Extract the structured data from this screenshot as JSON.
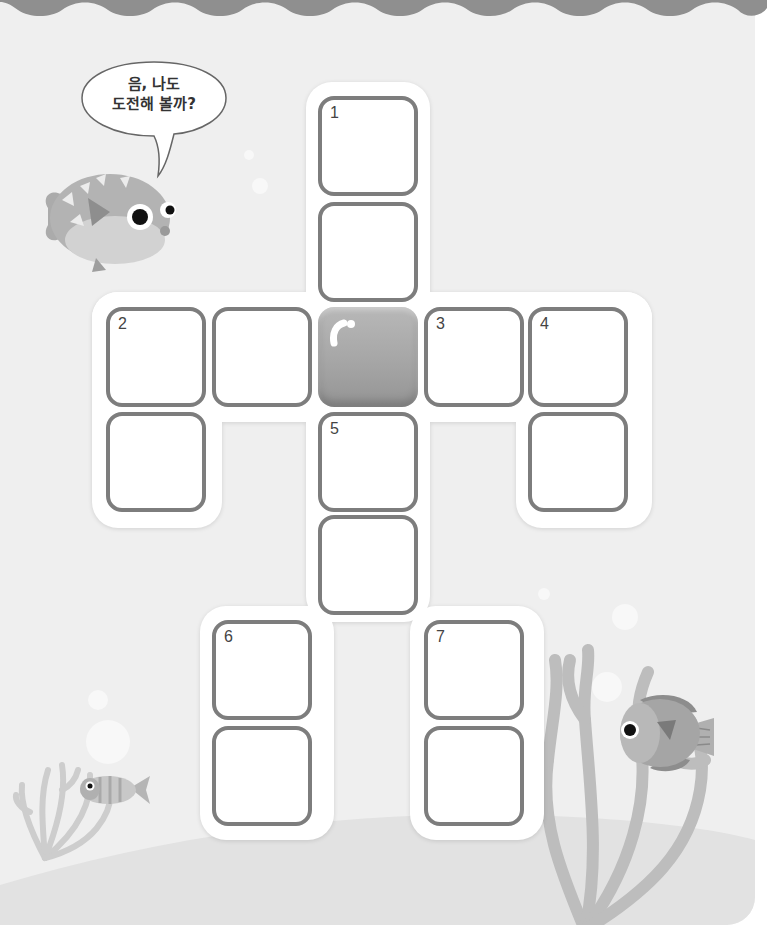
{
  "page": {
    "background_color": "#efefef",
    "wave_color": "#8f8f8f",
    "seafloor_color": "#e2e2e2"
  },
  "speech_bubble": {
    "line1": "음, 나도",
    "line2": "도전해 볼까?"
  },
  "characters": [
    {
      "name": "pufferfish",
      "position": "upper-left"
    },
    {
      "name": "striped-fish",
      "position": "lower-left"
    },
    {
      "name": "round-fish",
      "position": "lower-right"
    }
  ],
  "crossword": {
    "cell_border_color": "#7d7d7d",
    "cell_fill_color": "#ffffff",
    "blocked_cell_color": "#a8a8a8",
    "cells": [
      {
        "id": "r0c2",
        "x": 318,
        "y": 96,
        "number": "1",
        "blocked": false
      },
      {
        "id": "r1c2",
        "x": 318,
        "y": 202,
        "number": "",
        "blocked": false
      },
      {
        "id": "r2c0",
        "x": 106,
        "y": 307,
        "number": "2",
        "blocked": false
      },
      {
        "id": "r2c1",
        "x": 212,
        "y": 307,
        "number": "",
        "blocked": false
      },
      {
        "id": "r2c2",
        "x": 318,
        "y": 307,
        "number": "",
        "blocked": true
      },
      {
        "id": "r2c3",
        "x": 424,
        "y": 307,
        "number": "3",
        "blocked": false
      },
      {
        "id": "r2c4",
        "x": 528,
        "y": 307,
        "number": "4",
        "blocked": false
      },
      {
        "id": "r3c0",
        "x": 106,
        "y": 412,
        "number": "",
        "blocked": false
      },
      {
        "id": "r3c2",
        "x": 318,
        "y": 412,
        "number": "5",
        "blocked": false
      },
      {
        "id": "r3c4",
        "x": 528,
        "y": 412,
        "number": "",
        "blocked": false
      },
      {
        "id": "r4c2",
        "x": 318,
        "y": 515,
        "number": "",
        "blocked": false
      },
      {
        "id": "r5c1",
        "x": 212,
        "y": 620,
        "number": "6",
        "blocked": false
      },
      {
        "id": "r5c3",
        "x": 424,
        "y": 620,
        "number": "7",
        "blocked": false
      },
      {
        "id": "r6c1",
        "x": 212,
        "y": 726,
        "number": "",
        "blocked": false
      },
      {
        "id": "r6c3",
        "x": 424,
        "y": 726,
        "number": "",
        "blocked": false
      }
    ]
  }
}
